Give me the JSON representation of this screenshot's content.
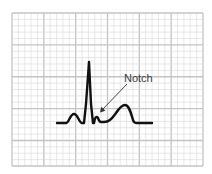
{
  "diagram": {
    "type": "ecg-strip",
    "annotation": {
      "label": "Notch",
      "target": "notch in ST segment after QRS complex"
    },
    "colors": {
      "background": "#ffffff",
      "grid_minor": "#d9d9d9",
      "grid_major": "#c4c4c4",
      "waveform": "#111111",
      "arrow": "#333333",
      "label": "#3a3a3a"
    },
    "grid": {
      "minor_cells_x": 30,
      "minor_cells_y": 24,
      "major_every": 5
    }
  }
}
